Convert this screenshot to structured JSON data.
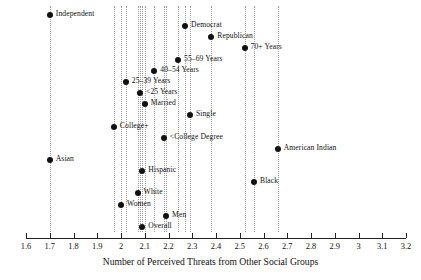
{
  "chart_data": {
    "type": "scatter",
    "title": "",
    "xlabel": "Number of Perceived Threats from Other Social Groups",
    "ylabel": "",
    "xlim": [
      1.6,
      3.2
    ],
    "xticks": [
      "1.6",
      "1.7",
      "1.8",
      "1.9",
      "2",
      "2.1",
      "2.2",
      "2.3",
      "2.4",
      "2.5",
      "2.6",
      "2.7",
      "2.8",
      "2.9",
      "3",
      "3.1",
      "3.2"
    ],
    "xtick_values": [
      1.6,
      1.7,
      1.8,
      1.9,
      2.0,
      2.1,
      2.2,
      2.3,
      2.4,
      2.5,
      2.6,
      2.7,
      2.8,
      2.9,
      3.0,
      3.1,
      3.2
    ],
    "grid": "vertical dotted reference line at each point value",
    "legend": "none",
    "marker": "filled black circle",
    "point_color": "#111111",
    "gridline_color": "#9a9a9a",
    "axis_color": "#222222",
    "categories": [
      "Independent",
      "Democrat",
      "Republican",
      "70+ Years",
      "55–69 Years",
      "40–54 Years",
      "25–39 Years",
      "<25 Years",
      "Married",
      "Single",
      "College+",
      "<College Degree",
      "American Indian",
      "Asian",
      "Hispanic",
      "Black",
      "White",
      "Women",
      "Men",
      "Overall"
    ],
    "points": [
      {
        "label": "Independent",
        "value": 1.7,
        "row": 0,
        "label_side": "right"
      },
      {
        "label": "Democrat",
        "value": 2.27,
        "row": 1,
        "label_side": "right"
      },
      {
        "label": "Republican",
        "value": 2.38,
        "row": 2,
        "label_side": "right"
      },
      {
        "label": "70+ Years",
        "value": 2.52,
        "row": 3,
        "label_side": "right"
      },
      {
        "label": "55–69 Years",
        "value": 2.24,
        "row": 4,
        "label_side": "right"
      },
      {
        "label": "40–54 Years",
        "value": 2.14,
        "row": 5,
        "label_side": "right"
      },
      {
        "label": "25–39 Years",
        "value": 2.02,
        "row": 6,
        "label_side": "right"
      },
      {
        "label": "<25 Years",
        "value": 2.08,
        "row": 7,
        "label_side": "right"
      },
      {
        "label": "Married",
        "value": 2.1,
        "row": 8,
        "label_side": "right"
      },
      {
        "label": "Single",
        "value": 2.29,
        "row": 9,
        "label_side": "right"
      },
      {
        "label": "College+",
        "value": 1.97,
        "row": 10,
        "label_side": "right"
      },
      {
        "label": "<College Degree",
        "value": 2.18,
        "row": 11,
        "label_side": "right"
      },
      {
        "label": "American Indian",
        "value": 2.66,
        "row": 12,
        "label_side": "right"
      },
      {
        "label": "Asian",
        "value": 1.7,
        "row": 13,
        "label_side": "right"
      },
      {
        "label": "Hispanic",
        "value": 2.09,
        "row": 14,
        "label_side": "right"
      },
      {
        "label": "Black",
        "value": 2.56,
        "row": 15,
        "label_side": "right"
      },
      {
        "label": "White",
        "value": 2.07,
        "row": 16,
        "label_side": "right"
      },
      {
        "label": "Women",
        "value": 2.0,
        "row": 17,
        "label_side": "right"
      },
      {
        "label": "Men",
        "value": 2.19,
        "row": 18,
        "label_side": "right"
      },
      {
        "label": "Overall",
        "value": 2.09,
        "row": 19,
        "label_side": "right"
      }
    ]
  },
  "axis": {
    "x_title": "Number of Perceived Threats from Other Social Groups"
  }
}
